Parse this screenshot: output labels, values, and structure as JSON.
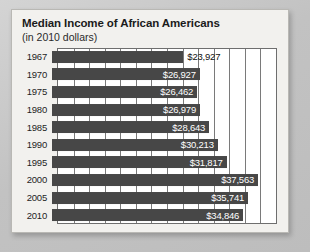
{
  "card": {
    "title": "Median Income of African Americans",
    "subtitle": "(in 2010 dollars)"
  },
  "colors": {
    "bar": "#474747",
    "plot_background": "#ffffff",
    "card_background": "#f2f1ee",
    "page_background": "#c8c8c8",
    "grid_line": "#7a7a7a",
    "axis_line": "#6e6e6e",
    "label_inside": "#ffffff",
    "label_outside": "#111111",
    "text": "#1b1b1b"
  },
  "chart_data": {
    "type": "bar",
    "orientation": "horizontal",
    "title": "Median Income of African Americans",
    "subtitle": "(in 2010 dollars)",
    "xlabel": "",
    "ylabel": "",
    "categories": [
      "1967",
      "1970",
      "1975",
      "1980",
      "1985",
      "1990",
      "1995",
      "2000",
      "2005",
      "2010"
    ],
    "values": [
      23927,
      26927,
      26462,
      26979,
      28643,
      30213,
      31817,
      37563,
      35741,
      34846
    ],
    "value_labels": [
      "$23,927",
      "$26,927",
      "$26,462",
      "$26,979",
      "$28,643",
      "$30,213",
      "$31,817",
      "$37,563",
      "$35,741",
      "$34,846"
    ],
    "label_position": [
      "outside",
      "inside",
      "inside",
      "inside",
      "inside",
      "inside",
      "inside",
      "inside",
      "inside",
      "inside"
    ],
    "xlim": [
      0,
      41000
    ],
    "grid": true,
    "gridline_count": 14,
    "tick_labels": [],
    "legend": null,
    "series": [
      {
        "name": "Median Income",
        "values": [
          23927,
          26927,
          26462,
          26979,
          28643,
          30213,
          31817,
          37563,
          35741,
          34846
        ]
      }
    ]
  }
}
